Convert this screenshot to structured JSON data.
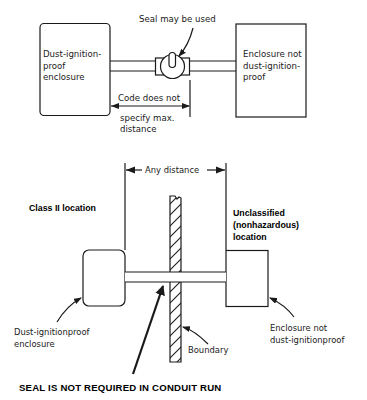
{
  "top_diagram": {
    "left_enclosure": [
      "Dust-ignition-",
      "proof",
      "enclosure"
    ],
    "right_enclosure": [
      "Enclosure not",
      "dust-ignition-",
      "proof"
    ],
    "seal_label": "Seal may be used",
    "distance_label": [
      "Code does not",
      "specify max.",
      "distance"
    ]
  },
  "bottom_diagram": {
    "dimension_label": "Any distance",
    "left_area_label": "Class II location",
    "right_area_label": [
      "Unclassified",
      "(nonhazardous)",
      "location"
    ],
    "left_enclosure_label": [
      "Dust-ignitionproof",
      "enclosure"
    ],
    "right_enclosure_label": [
      "Enclosure not",
      "dust-ignitionproof"
    ],
    "boundary_label": "Boundary",
    "caption": "SEAL IS NOT REQUIRED IN CONDUIT RUN"
  },
  "colors": {
    "ink": "#1a1a1a",
    "background": "#ffffff"
  }
}
